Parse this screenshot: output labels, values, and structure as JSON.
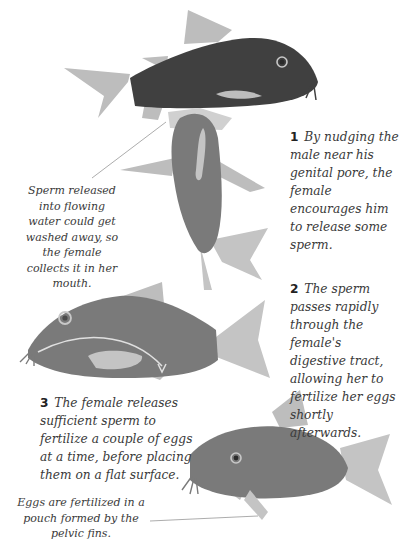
{
  "colors": {
    "background": "#ffffff",
    "male_body": "#404040",
    "female_body": "#7a7a7a",
    "fins": "#bdbdbd",
    "belly_patch": "#c4c4c4",
    "text": "#3a3a3a",
    "leader_line": "#888888"
  },
  "steps": [
    {
      "number": "1",
      "text": "By nudging the male near his genital pore, the female encourages him to release some sperm."
    },
    {
      "number": "2",
      "text": "The sperm passes rapidly through the female's digestive tract, allowing her to fertilize her eggs shortly afterwards."
    },
    {
      "number": "3",
      "text": "The female releases sufficient sperm to fertilize a couple of eggs at a time, before placing them on a flat surface."
    }
  ],
  "notes": {
    "mouth": "Sperm released into flowing water could get washed away, so the female collects it in her mouth.",
    "pouch": "Eggs are fertilized in a pouch formed by the pelvic fins."
  },
  "figures": [
    {
      "name": "male-fish",
      "color_role": "male_body"
    },
    {
      "name": "female-fish-top-view",
      "color_role": "female_body"
    },
    {
      "name": "female-fish-digestive",
      "color_role": "female_body"
    },
    {
      "name": "female-fish-egg-laying",
      "color_role": "female_body"
    }
  ]
}
